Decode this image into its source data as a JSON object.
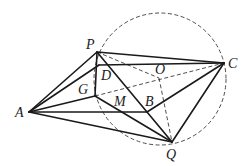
{
  "diagram": {
    "type": "geometry-figure",
    "points": {
      "P": {
        "x": 97,
        "y": 52,
        "label": "P",
        "lx": 86,
        "ly": 49
      },
      "C": {
        "x": 224,
        "y": 63,
        "label": "C",
        "lx": 228,
        "ly": 68
      },
      "A": {
        "x": 29,
        "y": 112,
        "label": "A",
        "lx": 15,
        "ly": 117
      },
      "Q": {
        "x": 172,
        "y": 142,
        "label": "Q",
        "lx": 166,
        "ly": 159
      },
      "D": {
        "x": 99,
        "y": 65,
        "label": "D",
        "lx": 101,
        "ly": 80
      },
      "G": {
        "x": 95,
        "y": 96,
        "label": "G",
        "lx": 78,
        "ly": 94
      },
      "O": {
        "x": 159,
        "y": 78,
        "label": "O",
        "lx": 155,
        "ly": 74
      },
      "B": {
        "x": 147,
        "y": 112,
        "label": "B",
        "lx": 145,
        "ly": 106
      },
      "M": {
        "x": 122,
        "y": 100,
        "label": "M",
        "lx": 114,
        "ly": 106
      }
    },
    "solid_segments": [
      [
        "P",
        "C"
      ],
      [
        "P",
        "A"
      ],
      [
        "P",
        "G"
      ],
      [
        "P",
        "Q"
      ],
      [
        "D",
        "C"
      ],
      [
        "A",
        "D"
      ],
      [
        "A",
        "G"
      ],
      [
        "A",
        "B"
      ],
      [
        "A",
        "Q"
      ],
      [
        "G",
        "Q"
      ],
      [
        "B",
        "C"
      ],
      [
        "C",
        "Q"
      ]
    ],
    "dashed_segments": [
      [
        "P",
        "O"
      ],
      [
        "G",
        "C"
      ],
      [
        "O",
        "Q"
      ]
    ],
    "circle": {
      "cx": 160,
      "cy": 79,
      "r": 66,
      "style": "dashed"
    }
  }
}
